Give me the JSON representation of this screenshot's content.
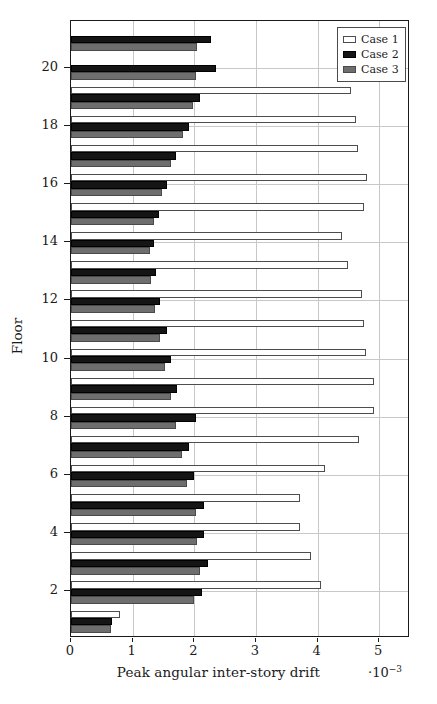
{
  "chart_data": {
    "type": "bar",
    "orientation": "horizontal",
    "title": "",
    "xlabel": "Peak angular inter-story drift",
    "ylabel": "Floor",
    "x_exponent": "·10⁻³",
    "xlim": [
      0,
      5.5
    ],
    "ylim": [
      0.4,
      21.6
    ],
    "xticks": [
      0,
      1,
      2,
      3,
      4,
      5
    ],
    "xticklabels": [
      "0",
      "1",
      "2",
      "3",
      "4",
      "5"
    ],
    "yticks": [
      2,
      4,
      6,
      8,
      10,
      12,
      14,
      16,
      18,
      20
    ],
    "yticklabels": [
      "2",
      "4",
      "6",
      "8",
      "10",
      "12",
      "14",
      "16",
      "18",
      "20"
    ],
    "grid": "both",
    "legend_position": "top-right",
    "legend": [
      "Case 1",
      "Case 2",
      "Case 3"
    ],
    "colors": {
      "case1": "#ffffff",
      "case2": "#151515",
      "case3": "#6e6e6e",
      "edge": "#4d4d4d",
      "grid": "#c8c8c8",
      "axis": "#1a1a1a"
    },
    "categories": [
      1,
      2,
      3,
      4,
      5,
      6,
      7,
      8,
      9,
      10,
      11,
      12,
      13,
      14,
      15,
      16,
      17,
      18,
      19,
      20,
      21
    ],
    "series": [
      {
        "name": "Case 1",
        "values": [
          0.8,
          4.05,
          3.9,
          3.72,
          3.72,
          4.12,
          4.68,
          4.92,
          4.92,
          4.78,
          4.75,
          4.72,
          4.5,
          4.4,
          4.75,
          4.8,
          4.65,
          4.62,
          4.55,
          0.0,
          0.0
        ]
      },
      {
        "name": "Case 2",
        "values": [
          0.67,
          2.12,
          2.22,
          2.15,
          2.15,
          2.0,
          1.92,
          2.02,
          1.72,
          1.62,
          1.55,
          1.45,
          1.38,
          1.35,
          1.42,
          1.55,
          1.7,
          1.92,
          2.1,
          2.35,
          2.27
        ]
      },
      {
        "name": "Case 3",
        "values": [
          0.65,
          2.0,
          2.1,
          2.05,
          2.02,
          1.88,
          1.8,
          1.7,
          1.62,
          1.52,
          1.45,
          1.36,
          1.3,
          1.28,
          1.35,
          1.48,
          1.62,
          1.82,
          1.98,
          2.02,
          2.05
        ]
      }
    ]
  }
}
